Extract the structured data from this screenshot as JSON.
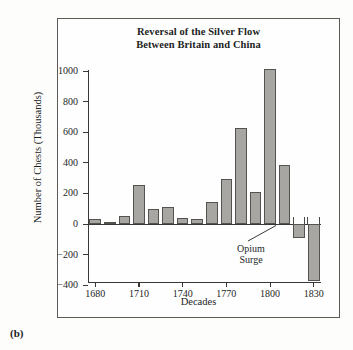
{
  "figure": {
    "panel_label": "(b)",
    "title_line1": "Reversal of the Silver Flow",
    "title_line2": "Between Britain and China"
  },
  "chart_data": {
    "type": "bar",
    "title": "Reversal of the Silver Flow Between Britain and China",
    "xlabel": "Decades",
    "ylabel": "Number of Chests (Thousands)",
    "ylim": [
      -400,
      1000
    ],
    "yticks": [
      -400,
      -200,
      0,
      200,
      400,
      600,
      800,
      1000
    ],
    "ytick_labels": [
      "−400",
      "−200",
      "0",
      "200",
      "400",
      "600",
      "800",
      "1000"
    ],
    "xticks": [
      1680,
      1710,
      1740,
      1770,
      1800,
      1830
    ],
    "xtick_labels": [
      "1680",
      "1710",
      "1740",
      "1770",
      "1800",
      "1830"
    ],
    "grid": false,
    "legend": false,
    "categories": [
      1680,
      1690,
      1700,
      1710,
      1720,
      1730,
      1740,
      1750,
      1760,
      1770,
      1780,
      1790,
      1800,
      1810,
      1820,
      1830
    ],
    "values": [
      30,
      12,
      55,
      258,
      100,
      110,
      40,
      30,
      145,
      295,
      630,
      210,
      1010,
      385,
      -90,
      -370
    ],
    "bar_color": "#a8a6a3",
    "bar_edge_color": "#55534f",
    "annotations": [
      {
        "text_line1": "Opium",
        "text_line2": "Surge",
        "points_to_category": 1820
      }
    ]
  }
}
